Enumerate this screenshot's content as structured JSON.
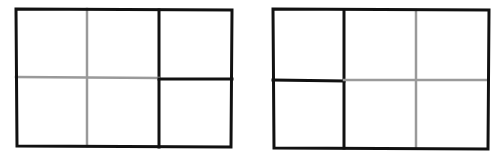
{
  "colors": {
    "background": "#ffffff",
    "black_line": "#111111",
    "gray_line": "#9a9a9a"
  },
  "figures": [
    {
      "name": "left-grid",
      "description": "Rectangle divided into 3 columns x 2 rows; first two columns separated by gray lines, third column split by black lines",
      "outer": {
        "x1": 16,
        "y1": 9,
        "x2": 232,
        "y2": 147
      },
      "lines": [
        {
          "id": "v-gray",
          "x1": 87,
          "y1": 9,
          "x2": 87,
          "y2": 146,
          "color": "gray"
        },
        {
          "id": "v-black",
          "x1": 159,
          "y1": 10,
          "x2": 159,
          "y2": 147,
          "color": "black"
        },
        {
          "id": "h-gray",
          "x1": 16,
          "y1": 77,
          "x2": 159,
          "y2": 78,
          "color": "gray"
        },
        {
          "id": "h-black",
          "x1": 159,
          "y1": 79,
          "x2": 232,
          "y2": 79,
          "color": "black"
        }
      ]
    },
    {
      "name": "right-grid",
      "description": "Rectangle divided into 3 columns x 2 rows; first column split by black lines, last two columns separated by gray lines",
      "outer": {
        "x1": 273,
        "y1": 9,
        "x2": 489,
        "y2": 149
      },
      "lines": [
        {
          "id": "v-black",
          "x1": 344,
          "y1": 11,
          "x2": 344,
          "y2": 148,
          "color": "black"
        },
        {
          "id": "v-gray",
          "x1": 416,
          "y1": 11,
          "x2": 416,
          "y2": 147,
          "color": "gray"
        },
        {
          "id": "h-black",
          "x1": 273,
          "y1": 80,
          "x2": 344,
          "y2": 81,
          "color": "black"
        },
        {
          "id": "h-gray",
          "x1": 344,
          "y1": 80,
          "x2": 488,
          "y2": 80,
          "color": "gray"
        }
      ]
    }
  ]
}
